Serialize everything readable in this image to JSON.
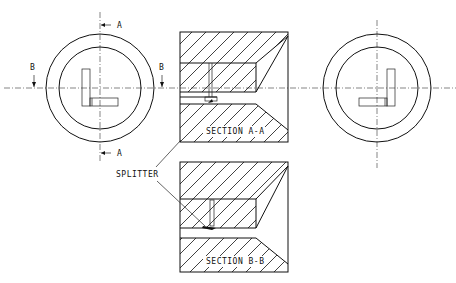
{
  "figure": {
    "type": "engineering-drawing",
    "views": [
      {
        "id": "left-end-view",
        "cutting_planes": [
          "A",
          "B"
        ]
      },
      {
        "id": "section-a-a",
        "caption": "SECTION A-A"
      },
      {
        "id": "section-b-b",
        "caption": "SECTION B-B"
      },
      {
        "id": "right-end-view"
      }
    ],
    "labels": {
      "cut_a_top": "A",
      "cut_a_bottom": "A",
      "cut_b_left": "B",
      "cut_b_right": "B",
      "section_aa": "SECTION A-A",
      "section_bb": "SECTION B-B",
      "splitter": "SPLITTER"
    },
    "colors": {
      "ink": "#111111",
      "background": "#ffffff"
    }
  }
}
